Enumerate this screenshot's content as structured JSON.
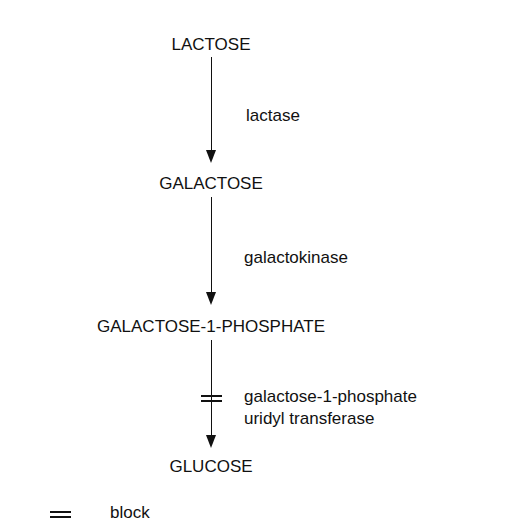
{
  "pathway": {
    "substrates": [
      "LACTOSE",
      "GALACTOSE",
      "GALACTOSE-1-PHOSPHATE",
      "GLUCOSE"
    ],
    "enzymes": [
      {
        "line1": "lactase",
        "line2": "",
        "blocked": false
      },
      {
        "line1": "galactokinase",
        "line2": "",
        "blocked": false
      },
      {
        "line1": "galactose-1-phosphate",
        "line2": "uridyl transferase",
        "blocked": true
      }
    ]
  },
  "legend": {
    "symbol": "=",
    "label": "block"
  }
}
